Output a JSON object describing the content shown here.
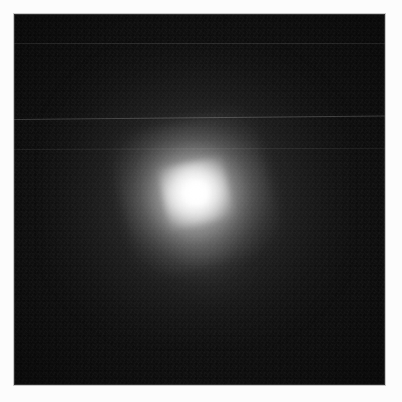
{
  "image": {
    "title": "Astronomical point source field",
    "kind": "grayscale-astronomical-frame",
    "frame": {
      "left_px": 14,
      "top_px": 14,
      "width_px": 371,
      "height_px": 371,
      "background_color": "#050505",
      "margin_color": "#fcfcfc"
    },
    "colors": {
      "margin": "#fcfcfc",
      "field_background": "#050505",
      "core_peak": "#ffffff",
      "halo_mid": "#d8d8d8",
      "halo_outer": "#4a4a4a",
      "frame_border": "#c9c9c9"
    },
    "source": {
      "label": "central point source",
      "center_x_px": 198,
      "center_y_px": 197,
      "core_radius_px": 13,
      "inner_halo_radius_px": 33,
      "mid_halo_radius_px": 75,
      "outer_halo_radius_px": 155,
      "peak_intensity": 255,
      "background_intensity": 6,
      "elongation_angle_deg": -12
    },
    "scanlines": [
      {
        "name": "scanline-upper",
        "y_px": 43,
        "opacity": 0.11,
        "tilt_deg": 0.0
      },
      {
        "name": "scanline-middle",
        "y_px": 119,
        "opacity": 0.2,
        "tilt_deg": -0.55
      },
      {
        "name": "scanline-lower",
        "y_px": 149,
        "opacity": 0.075,
        "tilt_deg": -0.2
      }
    ],
    "noise": {
      "label": "detector read noise grain",
      "grain_size_px": 2,
      "amplitude": 0.06
    }
  }
}
